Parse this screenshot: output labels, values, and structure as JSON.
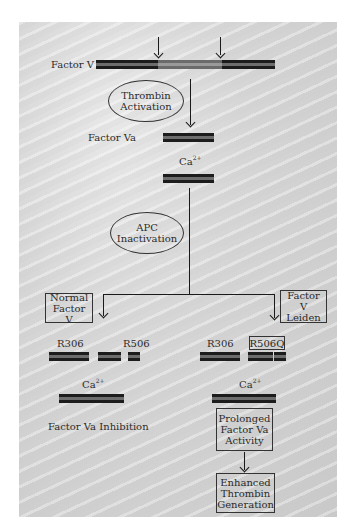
{
  "diagram": {
    "top": {
      "factor_v_label": "Factor V",
      "thrombin_oval": [
        "Thrombin",
        "Activation"
      ],
      "factor_va_label": "Factor Va",
      "ca_label": "Ca",
      "ca_superscript": "2+"
    },
    "apc_oval": [
      "APC",
      "Inactivation"
    ],
    "left_branch": {
      "box": [
        "Normal",
        "Factor V"
      ],
      "site1": "R306",
      "site2": "R506",
      "ca_label": "Ca",
      "ca_superscript": "2+",
      "outcome": "Factor Va Inhibition"
    },
    "right_branch": {
      "box": [
        "Factor V",
        "Leiden"
      ],
      "site1": "R306",
      "site2": "R506Q",
      "ca_label": "Ca",
      "ca_superscript": "2+",
      "outcome_box": [
        "Prolonged",
        "Factor Va",
        "Activity"
      ],
      "final_box": [
        "Enhanced",
        "Thrombin",
        "Generation"
      ]
    },
    "colors": {
      "background_panel": "#d4d4d4",
      "bar_dark": "#1c1c1c",
      "bar_stripe": "#6d6d6d",
      "line": "#1a1a1a"
    }
  }
}
